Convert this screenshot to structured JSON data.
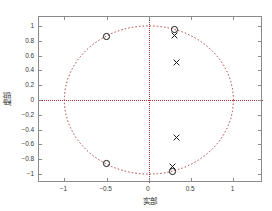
{
  "figure": {
    "background": "#ffffff",
    "frame_color": "#8a8a8a",
    "guide_color": "#b03030",
    "marker_color": "#1a1a1a"
  },
  "chart_data": {
    "type": "scatter",
    "title": "",
    "subtitle": "",
    "xlabel": "实部",
    "ylabel": "虚部",
    "xlim": [
      -1.3,
      1.35
    ],
    "ylim": [
      -1.12,
      1.12
    ],
    "grid": false,
    "legend": null,
    "xticks": [
      -1,
      -0.5,
      0,
      0.5,
      1
    ],
    "xticklabels": [
      "−1",
      "−0.5",
      "0",
      "0.5",
      "1"
    ],
    "yticks": [
      1,
      0.8,
      0.6,
      0.4,
      0.2,
      0,
      -0.2,
      -0.4,
      -0.6,
      -0.8,
      -1
    ],
    "yticklabels": [
      "1",
      "0.8",
      "0.6",
      "0.4",
      "0.2",
      "0",
      "−0.2",
      "−0.4",
      "−0.6",
      "−0.8",
      "−1"
    ],
    "annotations": [
      {
        "name": "unit-circle",
        "kind": "circle",
        "cx": 0,
        "cy": 0,
        "r": 1,
        "style": "dotted"
      },
      {
        "name": "real-axis",
        "kind": "hline",
        "y": 0,
        "style": "dotted"
      },
      {
        "name": "imag-axis",
        "kind": "vline",
        "x": 0,
        "style": "dotted"
      }
    ],
    "series": [
      {
        "name": "zeros",
        "marker": "o",
        "values": [
          {
            "x": 0.3,
            "y": 0.95
          },
          {
            "x": -0.5,
            "y": 0.86
          },
          {
            "x": -0.5,
            "y": -0.86
          },
          {
            "x": 0.28,
            "y": -0.97
          }
        ]
      },
      {
        "name": "poles",
        "marker": "x",
        "values": [
          {
            "x": 0.3,
            "y": 0.87
          },
          {
            "x": 0.33,
            "y": 0.5
          },
          {
            "x": 0.33,
            "y": -0.5
          },
          {
            "x": 0.28,
            "y": -0.9
          }
        ]
      }
    ]
  }
}
